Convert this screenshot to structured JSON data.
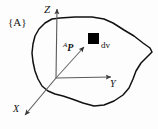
{
  "figure": {
    "background_color": "#fdfdfd",
    "ink_color": "#111111",
    "axis_color": "#5a5a5a",
    "width": 158,
    "height": 129
  },
  "labels": {
    "frame": "{A}",
    "z_axis": "Z",
    "y_axis": "Y",
    "x_axis": "X",
    "position_vector_sup": "A",
    "position_vector_name": "P",
    "volume_element": "dv"
  },
  "geometry": {
    "origin": {
      "x": 56,
      "y": 78
    },
    "z_axis_tip": {
      "x": 57,
      "y": 5
    },
    "y_axis_tip": {
      "x": 116,
      "y": 77
    },
    "x_axis_tip": {
      "x": 21,
      "y": 119
    },
    "point_marker": {
      "x": 88,
      "y": 33,
      "width": 11,
      "height": 11,
      "shape": "filled-square",
      "color": "#000000"
    },
    "vector_from": {
      "x": 56,
      "y": 78
    },
    "vector_to": {
      "x": 87,
      "y": 44
    },
    "body_outline": "M 60,18 L 75,17 L 92,17 L 104,19 L 113,23 L 124,30 L 134,36 L 143,43 L 150,48 L 152,52 L 147,57 L 141,63 L 136,71 L 133,79 L 129,88 L 123,95 L 114,101 L 104,105 L 94,106 L 83,103 L 72,99 L 63,96 L 55,94 L 48,91 L 42,86 L 38,79 L 35,71 L 33,62 L 32,53 L 33,44 L 35,36 L 39,29 L 45,23 L 52,19 Z"
  }
}
